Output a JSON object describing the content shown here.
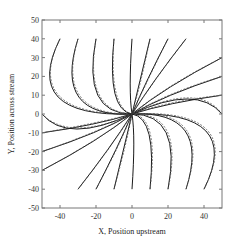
{
  "chart_data": {
    "type": "line",
    "title": "",
    "xlabel": "X, Position upstream",
    "ylabel": "Y, Position across stream",
    "xlim": [
      -50,
      50
    ],
    "ylim": [
      -50,
      50
    ],
    "xticks": [
      -40,
      -20,
      0,
      20,
      40
    ],
    "yticks": [
      -50,
      -40,
      -30,
      -20,
      -10,
      0,
      10,
      20,
      30,
      40,
      50
    ],
    "grid": false,
    "legend": null,
    "series": [
      {
        "name": "solid",
        "style": "solid",
        "description": "streamlines converging to origin"
      },
      {
        "name": "dashed",
        "style": "dashed",
        "description": "approximate streamlines converging to origin"
      }
    ],
    "start_points": {
      "top_edge_y40": [
        -40,
        -30,
        -20,
        -10,
        0,
        10,
        20,
        30
      ],
      "right_edge_x50": [
        30,
        20,
        10,
        0
      ],
      "bottom_edge_y-40": [
        40,
        30,
        20,
        10,
        0,
        -10,
        -20,
        -30
      ],
      "left_edge_x-50": [
        -30,
        -20,
        -10,
        0
      ]
    },
    "convergence_point": [
      0,
      0
    ],
    "symmetry": "180-degree rotational about origin"
  },
  "plot": {
    "left_px": 42,
    "right_px": 222,
    "top_px": 20,
    "bottom_px": 208,
    "line_color": "#1a1a1a",
    "dash_color": "#555555",
    "axis_color": "#777777"
  }
}
